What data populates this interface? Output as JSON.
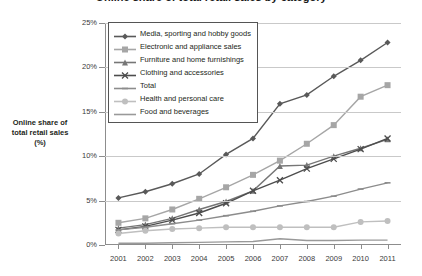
{
  "chart_data": {
    "type": "line",
    "title": "Online share of total retail sales by category",
    "xlabel": "",
    "ylabel": "Online share of total retail sales (%)",
    "ylabel_lines": [
      "Online share of",
      "total retail sales",
      "(%)"
    ],
    "x": [
      2001,
      2002,
      2003,
      2004,
      2005,
      2006,
      2007,
      2008,
      2009,
      2010,
      2011
    ],
    "xtick_labels": [
      "2001",
      "2002",
      "2003",
      "2004",
      "2005",
      "2006",
      "2007",
      "2008",
      "2009",
      "2010",
      "2011"
    ],
    "ylim": [
      0,
      25
    ],
    "ytick_values": [
      0,
      5,
      10,
      15,
      20,
      25
    ],
    "ytick_labels": [
      "0%",
      "5%",
      "10%",
      "15%",
      "20%",
      "25%"
    ],
    "grid": true,
    "legend_position": "top-left-inside",
    "series": [
      {
        "name": "Media, sporting and hobby goods",
        "marker": "diamond",
        "color": "#595959",
        "values": [
          5.3,
          6.0,
          6.9,
          8.0,
          10.2,
          12.0,
          15.9,
          16.9,
          19.0,
          20.8,
          22.8
        ]
      },
      {
        "name": "Electronic and appliance sales",
        "marker": "square",
        "color": "#a6a6a6",
        "values": [
          2.5,
          3.0,
          4.0,
          5.2,
          6.5,
          7.9,
          9.5,
          11.4,
          13.5,
          16.7,
          18.0
        ]
      },
      {
        "name": "Furniture and home furnishings",
        "marker": "triangle",
        "color": "#767676",
        "values": [
          1.9,
          2.3,
          3.0,
          4.0,
          4.9,
          6.1,
          8.9,
          9.0,
          10.0,
          10.9,
          11.9
        ]
      },
      {
        "name": "Clothing and accessories",
        "marker": "cross",
        "color": "#4d4d4d",
        "values": [
          1.7,
          2.1,
          2.8,
          3.6,
          4.7,
          6.1,
          7.3,
          8.6,
          9.7,
          10.8,
          12.0
        ]
      },
      {
        "name": "Total",
        "marker": "dash",
        "color": "#8c8c8c",
        "values": [
          1.7,
          2.0,
          2.4,
          2.8,
          3.3,
          3.8,
          4.4,
          4.9,
          5.5,
          6.3,
          7.0
        ]
      },
      {
        "name": "Health and personal care",
        "marker": "circle",
        "color": "#bfbfbf",
        "values": [
          1.3,
          1.6,
          1.8,
          1.9,
          2.0,
          2.0,
          2.0,
          2.0,
          2.0,
          2.6,
          2.7
        ]
      },
      {
        "name": "Food and beverages",
        "marker": "none",
        "color": "#999999",
        "values": [
          0.2,
          0.2,
          0.25,
          0.3,
          0.35,
          0.4,
          0.7,
          0.5,
          0.5,
          0.55,
          0.55
        ]
      }
    ]
  },
  "legend": {
    "items": [
      "Media, sporting and hobby goods",
      "Electronic and appliance sales",
      "Furniture and home furnishings",
      "Clothing and accessories",
      "Total",
      "Health and personal care",
      "Food and beverages"
    ]
  }
}
